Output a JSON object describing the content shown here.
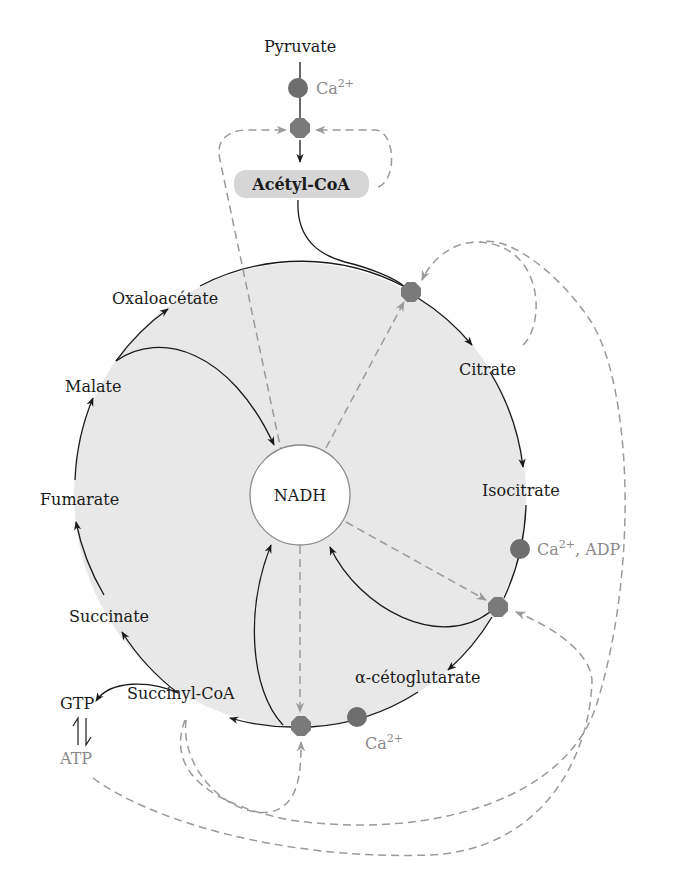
{
  "diagram": {
    "colors": {
      "cycle_fill": "#e8e8e8",
      "enzyme": "#7a7a7a",
      "activator": "#6e6e6e",
      "inhibitor_line": "#9a9a9a",
      "text": "#1a1a1a",
      "grey_text": "#8a8a8a",
      "acetyl_box": "#d6d6d6"
    },
    "top": {
      "pyruvate": "Pyruvate",
      "pdh_activator": "Ca",
      "pdh_activator_sup": "2+",
      "acetyl_coa": "Acétyl-CoA"
    },
    "center": {
      "label": "NADH"
    },
    "metabolites": [
      {
        "id": "oxaloacetate",
        "label": "Oxaloacétate"
      },
      {
        "id": "citrate",
        "label": "Citrate"
      },
      {
        "id": "isocitrate",
        "label": "Isocitrate"
      },
      {
        "id": "alpha-ketoglutarate",
        "label": "α-cétoglutarate"
      },
      {
        "id": "succinyl-coa",
        "label": "Succinyl-CoA"
      },
      {
        "id": "succinate",
        "label": "Succinate"
      },
      {
        "id": "fumarate",
        "label": "Fumarate"
      },
      {
        "id": "malate",
        "label": "Malate"
      }
    ],
    "activators": {
      "idh": {
        "ion": "Ca",
        "sup": "2+",
        "extra": ", ADP"
      },
      "akgdh": {
        "ion": "Ca",
        "sup": "2+"
      }
    },
    "side": {
      "gtp": "GTP",
      "atp": "ATP"
    },
    "enzymes": [
      {
        "id": "pyruvate-dehydrogenase",
        "x": 300,
        "y": 128
      },
      {
        "id": "citrate-synthase",
        "x": 411,
        "y": 292
      },
      {
        "id": "isocitrate-dehydrogenase",
        "x": 498,
        "y": 607
      },
      {
        "id": "alpha-ketoglutarate-dehydrogenase",
        "x": 301,
        "y": 726
      }
    ]
  }
}
